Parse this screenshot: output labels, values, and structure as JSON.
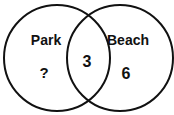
{
  "diagram": {
    "type": "venn",
    "sets": [
      {
        "label": "Park",
        "only_value": "?"
      },
      {
        "label": "Beach",
        "only_value": "6"
      }
    ],
    "intersection_value": "3",
    "stroke_color": "#111111",
    "background": "#ffffff"
  }
}
